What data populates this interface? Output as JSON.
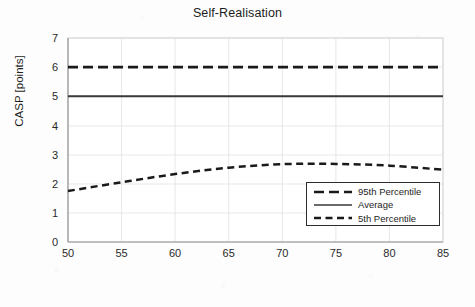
{
  "chart_data": {
    "type": "line",
    "title": "Self-Realisation",
    "xlabel": "Age [years]",
    "ylabel": "CASP [points]",
    "xlim": [
      50,
      85
    ],
    "ylim": [
      0,
      7
    ],
    "xticks": [
      50,
      55,
      60,
      65,
      70,
      75,
      80,
      85
    ],
    "yticks": [
      0,
      1,
      2,
      3,
      4,
      5,
      6,
      7
    ],
    "grid": "horizontal-and-vertical-light",
    "legend_position": "lower-right-inside",
    "x": [
      50,
      55,
      60,
      65,
      70,
      75,
      80,
      85
    ],
    "series": [
      {
        "name": "95th Percentile",
        "style": "dashed-long",
        "color": "#1a1a1a",
        "values": [
          6.0,
          6.0,
          6.0,
          6.0,
          6.0,
          6.0,
          6.0,
          6.0
        ]
      },
      {
        "name": "Average",
        "style": "solid",
        "color": "#3a3a3a",
        "values": [
          5.0,
          5.0,
          5.0,
          5.0,
          5.0,
          5.0,
          5.0,
          5.0
        ]
      },
      {
        "name": "5th Percentile",
        "style": "dashed-short",
        "color": "#1a1a1a",
        "values": [
          1.75,
          2.05,
          2.33,
          2.55,
          2.67,
          2.68,
          2.62,
          2.48
        ]
      }
    ]
  },
  "legend": {
    "items": [
      {
        "label": "95th Percentile"
      },
      {
        "label": "Average"
      },
      {
        "label": "5th Percentile"
      }
    ]
  },
  "axis": {
    "y_tick_labels": [
      "7",
      "6",
      "5",
      "4",
      "3",
      "2",
      "1",
      "0"
    ],
    "x_tick_labels": [
      "50",
      "55",
      "60",
      "65",
      "70",
      "75",
      "80",
      "85"
    ]
  }
}
